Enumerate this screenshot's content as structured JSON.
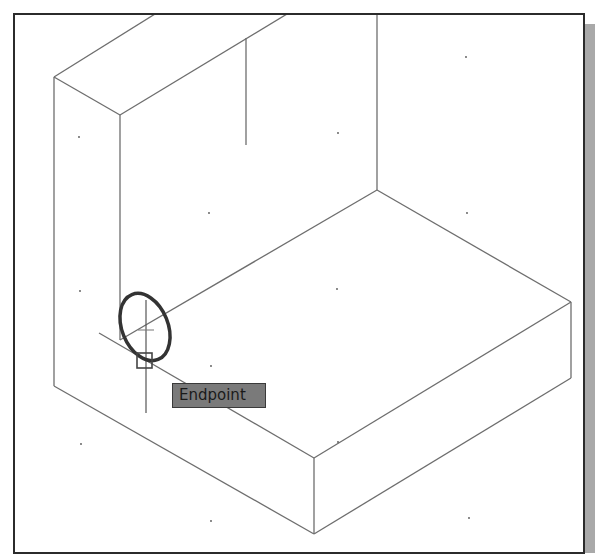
{
  "canvas": {
    "background": "#ffffff",
    "border_color": "#2b2b2b",
    "shadow_color": "#a9a9a9",
    "line_color": "#6e6e6e",
    "highlight_color": "#333333"
  },
  "model": {
    "name": "L-shaped block (isometric wireframe)",
    "edges": [
      [
        54,
        77,
        155,
        14
      ],
      [
        54,
        77,
        120,
        115
      ],
      [
        120,
        115,
        287,
        14
      ],
      [
        54,
        77,
        54,
        386
      ],
      [
        120,
        115,
        120,
        340
      ],
      [
        246,
        38,
        246,
        145
      ],
      [
        377,
        14,
        377,
        190
      ],
      [
        377,
        190,
        571,
        302
      ],
      [
        377,
        190,
        120,
        340
      ],
      [
        54,
        386,
        314,
        534
      ],
      [
        99,
        333,
        314,
        458
      ],
      [
        314,
        458,
        571,
        302
      ],
      [
        314,
        458,
        314,
        534
      ],
      [
        314,
        534,
        571,
        378
      ],
      [
        571,
        302,
        571,
        378
      ]
    ],
    "grid_dots": [
      [
        79,
        137
      ],
      [
        80,
        291
      ],
      [
        81,
        444
      ],
      [
        209,
        213
      ],
      [
        211,
        366
      ],
      [
        211,
        521
      ],
      [
        338,
        133
      ],
      [
        337,
        289
      ],
      [
        338,
        442
      ],
      [
        466,
        57
      ],
      [
        467,
        213
      ],
      [
        469,
        518
      ]
    ]
  },
  "cursor": {
    "crosshair_x": 146,
    "crosshair_y": 330,
    "vertical_line": [
      146,
      300,
      146,
      413
    ],
    "horizontal_tick": [
      138,
      330,
      154,
      330
    ]
  },
  "osnap": {
    "marker_type": "endpoint",
    "marker_box": {
      "x": 137,
      "y": 353,
      "size": 15
    },
    "highlight_ellipse": {
      "cx": 145,
      "cy": 327,
      "rx": 23,
      "ry": 35,
      "rotate": -22
    },
    "tooltip_label": "Endpoint"
  }
}
